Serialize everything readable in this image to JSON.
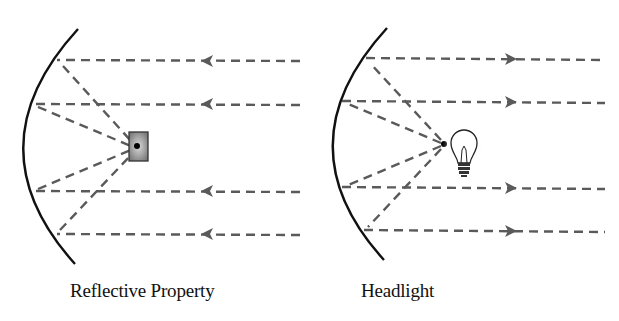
{
  "figure": {
    "panels": [
      {
        "id": "reflective-property",
        "caption": "Reflective Property",
        "ray_direction": "toward-mirror",
        "focus_object": "receiver-box"
      },
      {
        "id": "headlight",
        "caption": "Headlight",
        "ray_direction": "away-from-mirror",
        "focus_object": "light-bulb"
      }
    ],
    "colors": {
      "mirror": "#111111",
      "ray": "#5a5a5a",
      "focus_dot": "#000000",
      "receiver_fill": "#8a8a8a",
      "background": "#ffffff"
    }
  }
}
